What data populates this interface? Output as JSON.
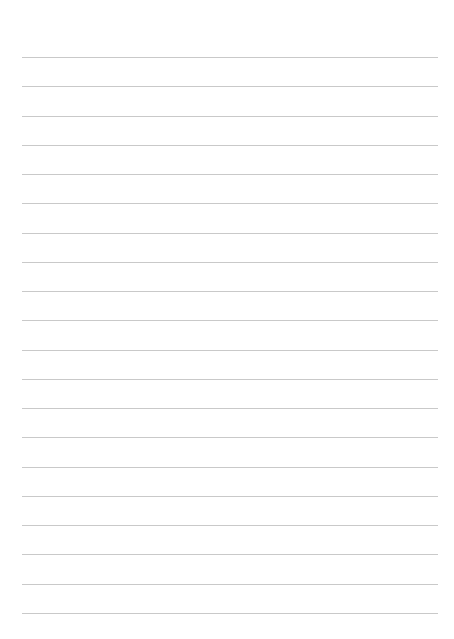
{
  "page": {
    "type": "lined-paper",
    "ruled_line_count": 20,
    "background_color": "#ffffff",
    "line_color": "#c9c9c9"
  }
}
